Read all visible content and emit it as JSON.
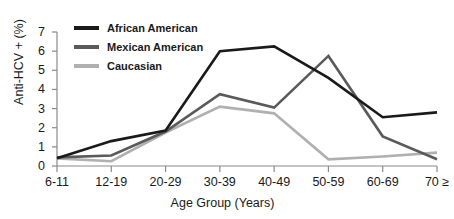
{
  "chart_data": {
    "type": "line",
    "title": "",
    "xlabel": "Age Group (Years)",
    "ylabel": "Anti-HCV + (%)",
    "categories": [
      "6-11",
      "12-19",
      "20-29",
      "30-39",
      "40-49",
      "50-59",
      "60-69",
      "70 ≥"
    ],
    "ytick_labels": [
      "0",
      "1",
      "2",
      "3",
      "4",
      "5",
      "6",
      "7"
    ],
    "yticks": [
      0,
      1,
      2,
      3,
      4,
      5,
      6,
      7
    ],
    "ylim": [
      0,
      7
    ],
    "grid": false,
    "legend_position": "top-left",
    "series": [
      {
        "name": "African American",
        "color": "#1a1a1a",
        "values": [
          0.4,
          1.3,
          1.85,
          6.0,
          6.25,
          4.6,
          2.55,
          2.8
        ]
      },
      {
        "name": "Mexican American",
        "color": "#5a5a5a",
        "values": [
          0.45,
          0.55,
          1.8,
          3.75,
          3.05,
          5.75,
          1.55,
          0.35
        ]
      },
      {
        "name": "Caucasian",
        "color": "#b0b0b0",
        "values": [
          0.4,
          0.25,
          1.75,
          3.1,
          2.75,
          0.35,
          0.5,
          0.7
        ]
      }
    ]
  },
  "legend": {
    "items": [
      {
        "label": "African American"
      },
      {
        "label": "Mexican American"
      },
      {
        "label": "Caucasian"
      }
    ]
  },
  "axes": {
    "x_title": "Age Group (Years)",
    "y_title": "Anti-HCV + (%)"
  }
}
